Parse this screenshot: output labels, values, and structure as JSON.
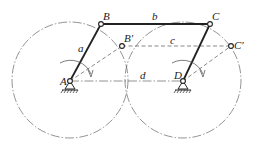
{
  "diagram": {
    "type": "four-bar linkage (crank-rocker) kinematic diagram",
    "points": {
      "A": {
        "label": "A",
        "x": 70,
        "y": 81
      },
      "B": {
        "label": "B",
        "x": 101,
        "y": 24
      },
      "B_prime": {
        "label": "B′",
        "x": 122,
        "y": 46
      },
      "C": {
        "label": "C",
        "x": 210,
        "y": 24
      },
      "C_prime": {
        "label": "C′",
        "x": 231,
        "y": 46
      },
      "D": {
        "label": "D",
        "x": 183,
        "y": 81
      }
    },
    "links": [
      {
        "name": "a",
        "label": "a",
        "from": "A",
        "to": "B",
        "style": "solid"
      },
      {
        "name": "b",
        "label": "b",
        "from": "B",
        "to": "C",
        "style": "solid"
      },
      {
        "name": "c",
        "label": "c",
        "from": "B′",
        "to": "C′",
        "style": "dashed"
      },
      {
        "name": "d",
        "label": "d",
        "from": "A",
        "to": "D",
        "style": "chain"
      }
    ],
    "circles": [
      {
        "center": "A",
        "radius": 58,
        "style": "chain"
      },
      {
        "center": "D",
        "radius": 58,
        "style": "chain"
      }
    ],
    "rotation_arrows": [
      {
        "around": "A"
      },
      {
        "around": "D"
      }
    ],
    "ground_supports": [
      "A",
      "D"
    ]
  }
}
